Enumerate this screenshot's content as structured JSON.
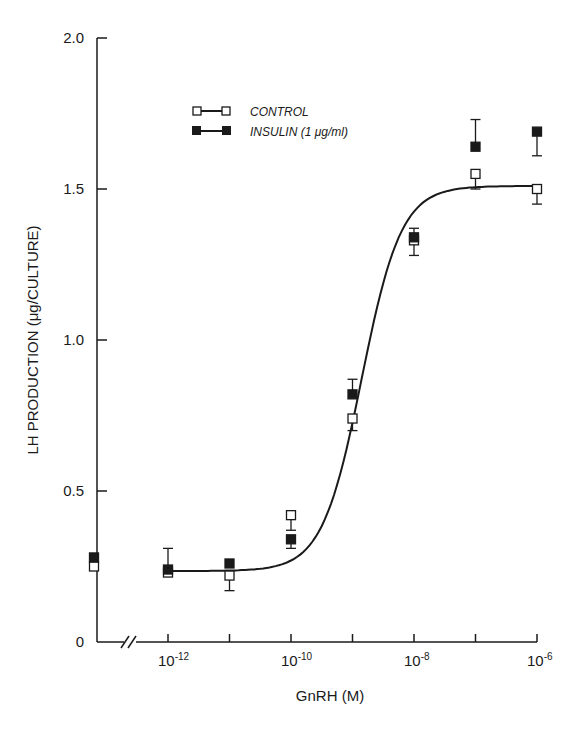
{
  "chart_data": {
    "type": "scatter",
    "title": "",
    "xlabel": "GnRH (M)",
    "ylabel": "LH PRODUCTION (μg/CULTURE)",
    "x_scale": "log",
    "x_ticks": [
      {
        "exp": -12,
        "label": "10",
        "sup": "-12"
      },
      {
        "exp": -11,
        "label": "",
        "sup": ""
      },
      {
        "exp": -10,
        "label": "10",
        "sup": "-10"
      },
      {
        "exp": -9,
        "label": "",
        "sup": ""
      },
      {
        "exp": -8,
        "label": "10",
        "sup": "-8"
      },
      {
        "exp": -7,
        "label": "",
        "sup": ""
      },
      {
        "exp": -6,
        "label": "10",
        "sup": "-6"
      }
    ],
    "y_ticks": [
      {
        "value": 0,
        "label": "0"
      },
      {
        "value": 0.5,
        "label": "0.5"
      },
      {
        "value": 1.0,
        "label": "1.0"
      },
      {
        "value": 1.5,
        "label": "1.5"
      },
      {
        "value": 2.0,
        "label": "2.0"
      }
    ],
    "ylim": [
      0,
      2.0
    ],
    "xlim_log10": [
      -12,
      -6
    ],
    "axis_break": true,
    "grid": false,
    "legend_position": "upper-left",
    "x_categories": [
      "basal (0)",
      "1e-12",
      "1e-11",
      "1e-10",
      "1e-9",
      "1e-8",
      "1e-7",
      "1e-6"
    ],
    "series": [
      {
        "name": "CONTROL",
        "marker": "open-square",
        "color": "#1a1a1a",
        "points": [
          {
            "x": "basal",
            "y": 0.25,
            "err_low": 0,
            "err_high": 0
          },
          {
            "x": -12,
            "y": 0.23,
            "err_low": 0.0,
            "err_high": 0.0
          },
          {
            "x": -11,
            "y": 0.22,
            "err_low": 0.05,
            "err_high": 0
          },
          {
            "x": -10,
            "y": 0.42,
            "err_low": 0.05,
            "err_high": 0
          },
          {
            "x": -9,
            "y": 0.74,
            "err_low": 0.04,
            "err_high": 0
          },
          {
            "x": -8,
            "y": 1.33,
            "err_low": 0.05,
            "err_high": 0
          },
          {
            "x": -7,
            "y": 1.55,
            "err_low": 0.05,
            "err_high": 0
          },
          {
            "x": -6,
            "y": 1.5,
            "err_low": 0.05,
            "err_high": 0
          }
        ]
      },
      {
        "name": "INSULIN (1 μg/ml)",
        "marker": "filled-square",
        "color": "#1a1a1a",
        "points": [
          {
            "x": "basal",
            "y": 0.28,
            "err_low": 0,
            "err_high": 0
          },
          {
            "x": -12,
            "y": 0.24,
            "err_low": 0,
            "err_high": 0.07
          },
          {
            "x": -11,
            "y": 0.26,
            "err_low": 0,
            "err_high": 0
          },
          {
            "x": -10,
            "y": 0.34,
            "err_low": 0.03,
            "err_high": 0
          },
          {
            "x": -9,
            "y": 0.82,
            "err_low": 0,
            "err_high": 0.05
          },
          {
            "x": -8,
            "y": 1.34,
            "err_low": 0,
            "err_high": 0.03
          },
          {
            "x": -7,
            "y": 1.64,
            "err_low": 0,
            "err_high": 0.09
          },
          {
            "x": -6,
            "y": 1.69,
            "err_low": 0.08,
            "err_high": 0
          }
        ]
      }
    ],
    "fit_curve": {
      "type": "sigmoid",
      "bottom": 0.235,
      "top": 1.51,
      "log_ec50": -8.85,
      "hill": 1.0
    }
  },
  "labels": {
    "y_axis_title": "LH PRODUCTION (μg/CULTURE)",
    "x_axis_title": "GnRH (M)",
    "legend_control": "CONTROL",
    "legend_insulin": "INSULIN (1 μg/ml)"
  }
}
